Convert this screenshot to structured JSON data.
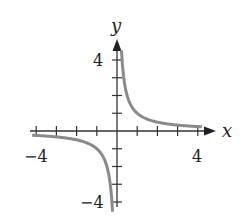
{
  "chart_data": {
    "type": "line",
    "title": "",
    "function": "y = 1/x",
    "xlabel": "x",
    "ylabel": "y",
    "xlim": [
      -4,
      4
    ],
    "ylim": [
      -4,
      4
    ],
    "x_tick_labels": [
      "-4",
      "4"
    ],
    "y_tick_labels": [
      "4",
      "-4"
    ],
    "ticks_every": 1,
    "grid": false,
    "series": [
      {
        "name": "branch-positive",
        "x": [
          0.25,
          0.5,
          1,
          2,
          3,
          4
        ],
        "values": [
          4,
          2,
          1,
          0.5,
          0.333,
          0.25
        ]
      },
      {
        "name": "branch-negative",
        "x": [
          -4,
          -3,
          -2,
          -1,
          -0.5,
          -0.25
        ],
        "values": [
          -0.25,
          -0.333,
          -0.5,
          -1,
          -2,
          -4
        ]
      }
    ],
    "curve_color": "#8a8a8a",
    "axis_color": "#333333"
  },
  "labels": {
    "x_axis": "x",
    "y_axis": "y",
    "x_min": "−4",
    "x_max": "4",
    "y_max": "4",
    "y_min": "−4"
  }
}
